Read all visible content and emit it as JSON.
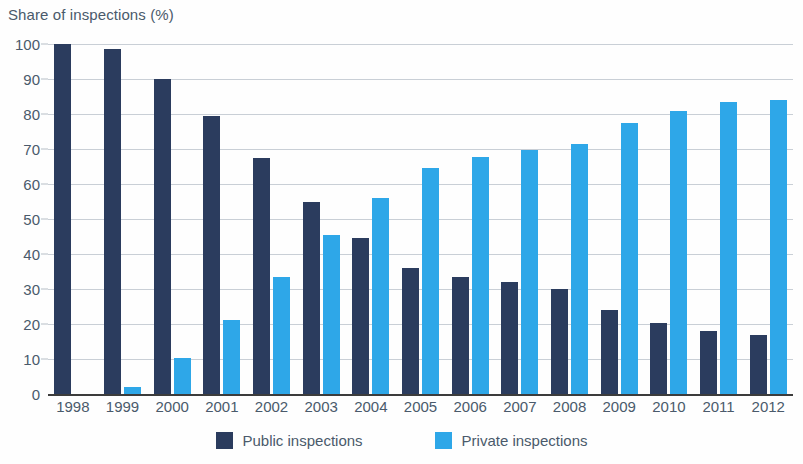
{
  "chart_data": {
    "type": "bar",
    "title": "Share of inspections (%)",
    "xlabel": "",
    "ylabel": "",
    "ylim": [
      0,
      100
    ],
    "yticks": [
      0,
      10,
      20,
      30,
      40,
      50,
      60,
      70,
      80,
      90,
      100
    ],
    "grid": true,
    "legend_position": "bottom",
    "categories": [
      "1998",
      "1999",
      "2000",
      "2001",
      "2002",
      "2003",
      "2004",
      "2005",
      "2006",
      "2007",
      "2008",
      "2009",
      "2010",
      "2011",
      "2012"
    ],
    "series": [
      {
        "name": "Public inspections",
        "color": "#2b3c5e",
        "values": [
          100,
          98.5,
          90,
          79.5,
          67.5,
          55,
          44.5,
          36,
          33.5,
          32,
          30,
          24,
          20.3,
          18,
          17
        ]
      },
      {
        "name": "Private inspections",
        "color": "#2ea7e8",
        "values": [
          0,
          2,
          10.3,
          21.2,
          33.3,
          45.5,
          56,
          64.7,
          67.8,
          69.7,
          71.5,
          77.5,
          81,
          83.5,
          84
        ]
      }
    ]
  },
  "legend": {
    "items": [
      {
        "label": "Public inspections",
        "swatch": "public"
      },
      {
        "label": "Private inspections",
        "swatch": "private"
      }
    ]
  },
  "colors": {
    "public": "#2b3c5e",
    "private": "#2ea7e8",
    "grid": "#c9cfd6",
    "axis": "#3c3c3c",
    "text": "#4a5a6b",
    "background": "#ffffff"
  }
}
